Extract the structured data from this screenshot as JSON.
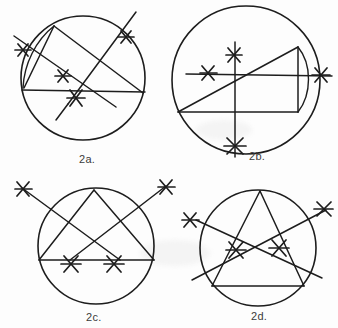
{
  "page": {
    "background_color": "#fdfdfd",
    "ink_color": "#1d1d1d",
    "faint_header_text": "",
    "width": 338,
    "height": 328
  },
  "figures": [
    {
      "id": "2a",
      "label": "2a.",
      "description": "Circle with an inscribed chord network: a horizontal chord, two long secant lines extending past the circle ending in hand-drawn asterisk marks, and a short arc near the upper-left rim.",
      "circle": {
        "cx": 75,
        "cy": 70,
        "r": 62
      },
      "marker_count": 4,
      "marker_symbol": "asterisk"
    },
    {
      "id": "2b",
      "label": "2b.",
      "description": "Large circle with a vertical diameter running past the bottom rim, a horizontal line running past the right rim, a rising diagonal chord, a lower horizontal chord, and a small arc bulging off the right side.",
      "circle": {
        "cx": 86,
        "cy": 78,
        "r": 74
      },
      "marker_count": 4,
      "marker_symbol": "asterisk"
    },
    {
      "id": "2c",
      "label": "2c.",
      "description": "Circle with an inscribed triangle standing on a horizontal chord; two long crossing lines run from inside the triangle out beyond the circle to asterisk marks at upper-left and upper-right.",
      "circle": {
        "cx": 82,
        "cy": 68,
        "r": 58
      },
      "marker_count": 4,
      "marker_symbol": "asterisk"
    },
    {
      "id": "2d",
      "label": "2d.",
      "description": "Circle with an inscribed triangle and two crossing secant lines that exit the circle at the left and the upper right, each terminating in an asterisk mark.",
      "circle": {
        "cx": 78,
        "cy": 66,
        "r": 58
      },
      "marker_count": 4,
      "marker_symbol": "asterisk"
    }
  ]
}
